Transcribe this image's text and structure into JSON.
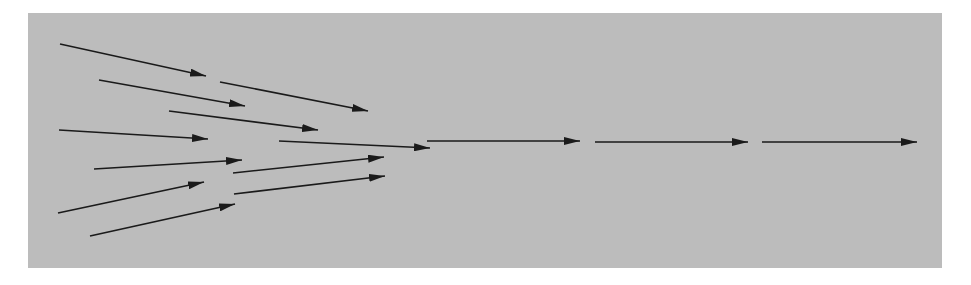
{
  "diagram": {
    "colors": {
      "background": "#ffffff",
      "panel": "#bcbcbc",
      "arrow": "#1a1a1a"
    },
    "arrows": [
      {
        "id": "a1",
        "x1": 60,
        "y1": 44,
        "x2": 206,
        "y2": 76
      },
      {
        "id": "a2",
        "x1": 99,
        "y1": 80,
        "x2": 245,
        "y2": 106
      },
      {
        "id": "a3",
        "x1": 169,
        "y1": 111,
        "x2": 318,
        "y2": 130
      },
      {
        "id": "a4",
        "x1": 59,
        "y1": 130,
        "x2": 208,
        "y2": 139
      },
      {
        "id": "a5",
        "x1": 94,
        "y1": 169,
        "x2": 242,
        "y2": 160
      },
      {
        "id": "a6",
        "x1": 58,
        "y1": 213,
        "x2": 204,
        "y2": 182
      },
      {
        "id": "a7",
        "x1": 90,
        "y1": 236,
        "x2": 235,
        "y2": 204
      },
      {
        "id": "a8",
        "x1": 220,
        "y1": 82,
        "x2": 368,
        "y2": 111
      },
      {
        "id": "a9",
        "x1": 279,
        "y1": 141,
        "x2": 430,
        "y2": 148
      },
      {
        "id": "a10",
        "x1": 233,
        "y1": 173,
        "x2": 384,
        "y2": 157
      },
      {
        "id": "a11",
        "x1": 234,
        "y1": 194,
        "x2": 385,
        "y2": 176
      },
      {
        "id": "h1",
        "x1": 427,
        "y1": 141,
        "x2": 580,
        "y2": 141
      },
      {
        "id": "h2",
        "x1": 595,
        "y1": 142,
        "x2": 748,
        "y2": 142
      },
      {
        "id": "h3",
        "x1": 762,
        "y1": 142,
        "x2": 917,
        "y2": 142
      }
    ]
  }
}
